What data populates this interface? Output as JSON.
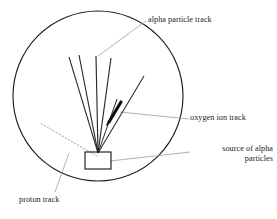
{
  "figure": {
    "background_color": "#ffffff",
    "stroke_color": "#1d1d1d",
    "leader_color": "#8a8a8a",
    "proton_track_color": "#b9b9b9",
    "labels": {
      "alpha_particle_track": "alpha particle track",
      "oxygen_ion_track": "oxygen ion track",
      "source_of_alpha_line1": "source of alpha",
      "source_of_alpha_line2": "particles",
      "proton_track": "proton track"
    },
    "geometry": {
      "chamber_circle": {
        "cx": 98,
        "cy": 96,
        "r": 85
      },
      "source_box": {
        "x": 85,
        "y": 152,
        "width": 26,
        "height": 17
      },
      "track_origin": {
        "x": 98,
        "y": 153
      },
      "alpha_tracks": [
        {
          "x1": 98,
          "y1": 153,
          "x2": 69,
          "y2": 57
        },
        {
          "x1": 98,
          "y1": 153,
          "x2": 79,
          "y2": 55
        },
        {
          "x1": 98,
          "y1": 153,
          "x2": 96,
          "y2": 56
        },
        {
          "x1": 98,
          "y1": 153,
          "x2": 111,
          "y2": 58
        },
        {
          "x1": 98,
          "y1": 153,
          "x2": 117,
          "y2": 99
        },
        {
          "x1": 98,
          "y1": 153,
          "x2": 144,
          "y2": 76
        }
      ],
      "oxygen_ion_track": {
        "x1": 109,
        "y1": 122,
        "x2": 122,
        "y2": 101
      },
      "proton_track": {
        "x1": 97,
        "y1": 156,
        "x2": 40,
        "y2": 123
      },
      "leader_alpha": {
        "x1": 98,
        "y1": 56,
        "x2": 146,
        "y2": 21
      },
      "leader_oxygen": {
        "x1": 120,
        "y1": 112,
        "x2": 189,
        "y2": 119
      },
      "leader_source": {
        "x1": 110,
        "y1": 161,
        "x2": 190,
        "y2": 152
      },
      "leader_proton": {
        "x1": 69,
        "y1": 153,
        "x2": 55,
        "y2": 192
      }
    }
  }
}
